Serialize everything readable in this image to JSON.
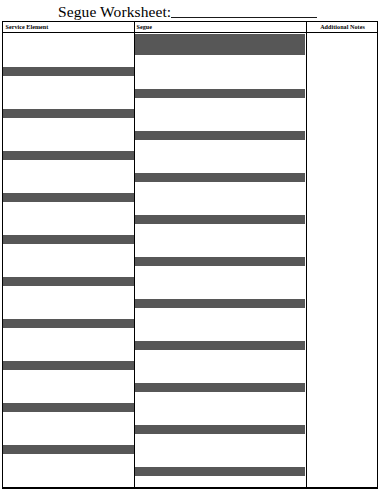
{
  "page": {
    "title": "Segue Worksheet:",
    "title_blank_line": "",
    "background_color": "#ffffff",
    "text_color": "#000000",
    "fill_color": "#575757",
    "border_color": "#000000"
  },
  "table": {
    "columns": [
      {
        "key": "service_element",
        "header": "Service Element",
        "x": 0,
        "width": 131
      },
      {
        "key": "segue",
        "header": "Segue",
        "x": 131,
        "width": 172
      },
      {
        "key": "additional_notes",
        "header": "Additional Notes",
        "x": 303,
        "width": 73
      }
    ],
    "service_element_bars": [
      {
        "top": 34,
        "height": 9
      },
      {
        "top": 76,
        "height": 9
      },
      {
        "top": 118,
        "height": 9
      },
      {
        "top": 160,
        "height": 9
      },
      {
        "top": 202,
        "height": 9
      },
      {
        "top": 244,
        "height": 9
      },
      {
        "top": 286,
        "height": 9
      },
      {
        "top": 328,
        "height": 9
      },
      {
        "top": 370,
        "height": 9
      },
      {
        "top": 412,
        "height": 9
      },
      {
        "top": 434,
        "height": 0
      }
    ],
    "segue_bars": [
      {
        "top": 1,
        "height": 21
      },
      {
        "top": 56,
        "height": 9
      },
      {
        "top": 98,
        "height": 9
      },
      {
        "top": 140,
        "height": 9
      },
      {
        "top": 182,
        "height": 9
      },
      {
        "top": 224,
        "height": 9
      },
      {
        "top": 266,
        "height": 9
      },
      {
        "top": 308,
        "height": 9
      },
      {
        "top": 350,
        "height": 9
      },
      {
        "top": 392,
        "height": 9
      },
      {
        "top": 434,
        "height": 9
      }
    ],
    "additional_notes_bars": []
  }
}
